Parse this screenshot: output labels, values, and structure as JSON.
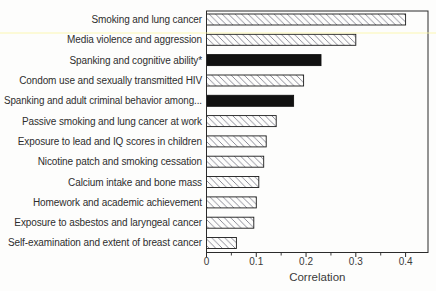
{
  "figure": {
    "background": "#fdfdfc",
    "note": "horizontal bar chart of meta-analytic correlations; solid black bars highlight spanking outcomes, other bars are white with diagonal hatching"
  },
  "chart_data": {
    "type": "bar",
    "orientation": "horizontal",
    "title": "",
    "xlabel": "Correlation",
    "ylabel": "",
    "xlim": [
      0,
      0.445
    ],
    "grid": false,
    "legend": "none",
    "categories": [
      "Smoking and lung cancer",
      "Media violence and aggression",
      "Spanking and cognitive ability*",
      "Condom use and sexually transmitted HIV",
      "Spanking and adult criminal behavior among...",
      "Passive smoking and lung cancer at work",
      "Exposure to lead and IQ scores in children",
      "Nicotine patch and smoking cessation",
      "Calcium intake and bone mass",
      "Homework and academic achievement",
      "Exposure to asbestos and laryngeal cancer",
      "Self-examination and extent of breast cancer"
    ],
    "values": [
      0.4,
      0.3,
      0.23,
      0.195,
      0.175,
      0.14,
      0.12,
      0.115,
      0.105,
      0.1,
      0.095,
      0.06
    ],
    "bar_styles": [
      "hatch",
      "hatch",
      "solid",
      "hatch",
      "solid",
      "hatch",
      "hatch",
      "hatch",
      "hatch",
      "hatch",
      "hatch",
      "hatch"
    ],
    "x_major_ticks": [
      0,
      0.1,
      0.2,
      0.3,
      0.4
    ],
    "x_tick_labels": [
      "0",
      "0.1",
      "0.2",
      "0.3",
      "0.4"
    ],
    "x_minor_ticks": [
      0.05,
      0.15,
      0.25,
      0.35
    ],
    "colors": {
      "solid_bar": "#111111",
      "bar_fill": "#fdfdfc",
      "hatch_line": "#70707e",
      "bar_border": "#1a1a1a",
      "frame": "#2b2b2b",
      "text": "#2e2e2e"
    }
  }
}
